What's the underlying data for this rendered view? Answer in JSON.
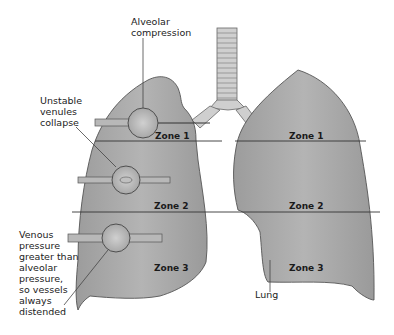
{
  "annotations": {
    "alveolar": [
      "Alveolar",
      "compression"
    ],
    "unstable": [
      "Unstable",
      "venules",
      "collapse"
    ],
    "venous": [
      "Venous",
      "pressure",
      "greater than",
      "alveolar",
      "pressure,",
      "so vessels",
      "always",
      "distended"
    ],
    "lung": "Lung"
  },
  "zones": {
    "left": {
      "zone1": "Zone 1",
      "zone2": "Zone 2",
      "zone3": "Zone 3"
    },
    "right": {
      "zone1": "Zone 1",
      "zone2": "Zone 2",
      "zone3": "Zone 3"
    }
  },
  "colors": {
    "lung_fill": "#a9a9a9",
    "outline": "#555555",
    "line": "#333333"
  }
}
